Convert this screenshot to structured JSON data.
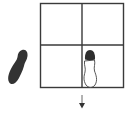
{
  "diagram": {
    "type": "footprint-grid",
    "grid": {
      "rows": 2,
      "cols": 2,
      "line_color": "#3a3a3a"
    },
    "footprints": [
      {
        "id": "outside-left",
        "style": "filled",
        "color": "#333333",
        "position": "left of grid, lower row"
      },
      {
        "id": "cell-bottom-right",
        "style": "outlined-with-dark-toe",
        "outline_color": "#444444",
        "toe_color": "#2e2e2e",
        "position": "bottom-right cell"
      }
    ],
    "arrow": {
      "direction": "down",
      "color": "#333333",
      "position": "below grid, center"
    }
  }
}
